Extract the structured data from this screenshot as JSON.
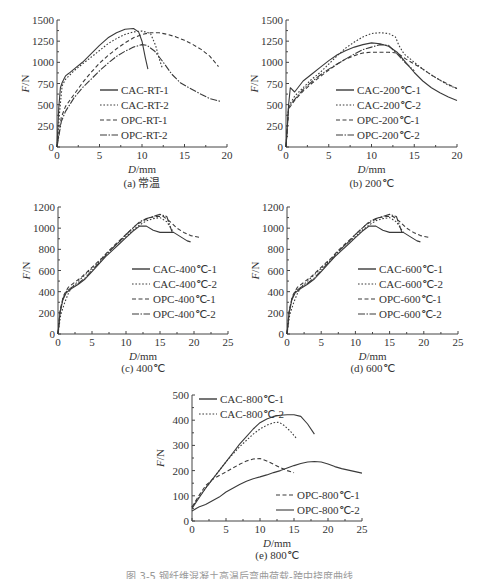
{
  "figure": {
    "caption_partial": "图 3-5  钢纤维混凝土高温后弯曲荷载-跨中挠度曲线"
  },
  "chart_data": [
    {
      "id": "a",
      "type": "line",
      "title": "(a) 常温",
      "xlabel": "D/mm",
      "ylabel": "F/N",
      "xlim": [
        0,
        20
      ],
      "ylim": [
        0,
        1500
      ],
      "xticks": [
        0,
        5,
        10,
        15,
        20
      ],
      "yticks": [
        0,
        250,
        500,
        750,
        1000,
        1250,
        1500
      ],
      "legend_position": "center-right",
      "series": [
        {
          "name": "CAC-RT-1",
          "style": "solid",
          "x": [
            0,
            0.2,
            0.4,
            0.6,
            0.8,
            1.0,
            1.4,
            2,
            3,
            4,
            5,
            6,
            7,
            8,
            9,
            9.6,
            10,
            10.4,
            10.7
          ],
          "y": [
            0,
            450,
            700,
            760,
            800,
            840,
            870,
            920,
            1000,
            1100,
            1200,
            1290,
            1350,
            1390,
            1400,
            1360,
            1250,
            1050,
            920
          ]
        },
        {
          "name": "CAC-RT-2",
          "style": "dotted",
          "x": [
            0,
            0.3,
            0.6,
            1,
            2,
            3,
            4,
            5,
            6,
            7,
            8,
            9,
            10,
            11,
            11.6,
            12,
            12.4
          ],
          "y": [
            0,
            400,
            720,
            800,
            900,
            980,
            1060,
            1140,
            1220,
            1280,
            1330,
            1360,
            1370,
            1340,
            1200,
            1050,
            930
          ]
        },
        {
          "name": "OPC-RT-1",
          "style": "dashed",
          "x": [
            0,
            0.5,
            1,
            2,
            3,
            4,
            5,
            6,
            7,
            8,
            9,
            10,
            11,
            12,
            13,
            14,
            15,
            16,
            17,
            18,
            19
          ],
          "y": [
            0,
            350,
            480,
            620,
            760,
            880,
            990,
            1080,
            1160,
            1230,
            1290,
            1330,
            1350,
            1350,
            1330,
            1300,
            1260,
            1210,
            1150,
            1070,
            950
          ]
        },
        {
          "name": "OPC-RT-2",
          "style": "dashdot",
          "x": [
            0,
            0.5,
            1,
            2,
            3,
            4,
            5,
            6,
            7,
            8,
            9,
            10,
            10.6,
            11.5,
            12.5,
            13.5,
            14.5,
            15.5,
            17,
            18,
            19.2
          ],
          "y": [
            0,
            300,
            420,
            580,
            700,
            800,
            900,
            990,
            1070,
            1130,
            1180,
            1210,
            1200,
            1130,
            1000,
            860,
            760,
            700,
            620,
            570,
            540
          ]
        }
      ]
    },
    {
      "id": "b",
      "type": "line",
      "title": "(b) 200℃",
      "xlabel": "D/mm",
      "ylabel": "F/N",
      "xlim": [
        0,
        20
      ],
      "ylim": [
        0,
        1500
      ],
      "xticks": [
        0,
        5,
        10,
        15,
        20
      ],
      "yticks": [
        0,
        250,
        500,
        750,
        1000,
        1250,
        1500
      ],
      "legend_position": "center-right",
      "series": [
        {
          "name": "CAC-200℃-1",
          "style": "solid",
          "x": [
            0,
            0.3,
            0.5,
            1,
            2,
            3,
            4,
            5,
            6,
            7,
            8,
            9,
            10,
            11,
            12,
            13,
            14,
            15,
            16,
            17,
            18,
            19,
            20
          ],
          "y": [
            0,
            500,
            700,
            650,
            780,
            860,
            940,
            1020,
            1090,
            1140,
            1180,
            1210,
            1230,
            1220,
            1190,
            1120,
            1000,
            880,
            780,
            700,
            640,
            590,
            550
          ]
        },
        {
          "name": "CAC-200℃-2",
          "style": "dotted",
          "x": [
            0,
            0.3,
            1,
            2,
            3,
            4,
            5,
            6,
            7,
            8,
            9,
            10,
            11,
            12,
            12.8,
            13.2,
            13.8,
            15,
            16,
            17,
            18,
            19,
            20
          ],
          "y": [
            0,
            480,
            600,
            700,
            800,
            880,
            980,
            1080,
            1170,
            1240,
            1300,
            1340,
            1350,
            1340,
            1300,
            1200,
            1100,
            1000,
            920,
            850,
            790,
            730,
            690
          ]
        },
        {
          "name": "OPC-200℃-1",
          "style": "dashed",
          "x": [
            0,
            0.3,
            1,
            2,
            3,
            4,
            5,
            6,
            7,
            8,
            9,
            10,
            11,
            12,
            13,
            14,
            15,
            16,
            17,
            18,
            19,
            20
          ],
          "y": [
            0,
            450,
            550,
            660,
            750,
            830,
            910,
            980,
            1040,
            1080,
            1110,
            1120,
            1120,
            1120,
            1110,
            1040,
            980,
            920,
            850,
            790,
            740,
            690
          ]
        },
        {
          "name": "OPC-200℃-2",
          "style": "dashdot",
          "x": [
            0,
            0.3,
            1,
            2,
            3,
            4,
            5,
            6,
            7,
            8,
            9,
            10,
            11,
            12,
            13,
            14,
            15
          ],
          "y": [
            0,
            470,
            560,
            680,
            770,
            850,
            920,
            980,
            1040,
            1100,
            1150,
            1180,
            1210,
            1200,
            1100,
            990,
            900
          ]
        }
      ]
    },
    {
      "id": "c",
      "type": "line",
      "title": "(c) 400℃",
      "xlabel": "D/mm",
      "ylabel": "F/N",
      "xlim": [
        0,
        25
      ],
      "ylim": [
        0,
        1200
      ],
      "xticks": [
        0,
        5,
        10,
        15,
        20,
        25
      ],
      "yticks": [
        0,
        200,
        400,
        600,
        800,
        1000,
        1200
      ],
      "legend_position": "center-right",
      "series": [
        {
          "name": "CAC-400℃-1",
          "style": "solid",
          "x": [
            0,
            0.3,
            0.7,
            1.2,
            2,
            3,
            4,
            5,
            6,
            7,
            8,
            9,
            10,
            11,
            12,
            13,
            14,
            15,
            16,
            17,
            18,
            19,
            19.5
          ],
          "y": [
            0,
            200,
            320,
            390,
            430,
            470,
            520,
            590,
            660,
            730,
            790,
            850,
            910,
            970,
            1020,
            1020,
            980,
            960,
            960,
            960,
            920,
            880,
            870
          ]
        },
        {
          "name": "CAC-400℃-2",
          "style": "dotted",
          "x": [
            0,
            0.4,
            1,
            1.5,
            2,
            3,
            4,
            5,
            6,
            7,
            8,
            9,
            10,
            11,
            12,
            13,
            14,
            15,
            16,
            17
          ],
          "y": [
            0,
            180,
            300,
            380,
            440,
            500,
            560,
            620,
            680,
            750,
            810,
            870,
            920,
            980,
            1030,
            1070,
            1090,
            1100,
            1060,
            960
          ]
        },
        {
          "name": "OPC-400℃-1",
          "style": "dashed",
          "x": [
            0,
            0.3,
            0.8,
            1.5,
            2.5,
            3.5,
            4.5,
            5.5,
            6.5,
            7.5,
            8.5,
            9.5,
            10.5,
            11.5,
            12.5,
            13.5,
            14.5,
            15.5,
            16.5,
            17.5,
            18.5,
            19.5,
            21
          ],
          "y": [
            0,
            220,
            360,
            440,
            490,
            540,
            600,
            660,
            720,
            790,
            850,
            910,
            970,
            1030,
            1070,
            1100,
            1110,
            1110,
            1060,
            1000,
            960,
            930,
            910
          ]
        },
        {
          "name": "OPC-400℃-2",
          "style": "dashdot",
          "x": [
            0,
            0.3,
            0.7,
            1.2,
            2,
            3,
            4,
            5,
            6,
            7,
            8,
            9,
            10,
            11,
            12,
            13,
            14,
            15,
            16,
            16.8
          ],
          "y": [
            0,
            200,
            330,
            400,
            440,
            480,
            530,
            600,
            670,
            740,
            810,
            870,
            940,
            1000,
            1060,
            1090,
            1110,
            1130,
            1110,
            960
          ]
        }
      ]
    },
    {
      "id": "d",
      "type": "line",
      "title": "(d) 600℃",
      "xlabel": "D/mm",
      "ylabel": "F/N",
      "xlim": [
        0,
        25
      ],
      "ylim": [
        0,
        1200
      ],
      "xticks": [
        0,
        5,
        10,
        15,
        20,
        25
      ],
      "yticks": [
        0,
        200,
        400,
        600,
        800,
        1000,
        1200
      ],
      "legend_position": "center-right",
      "series": [
        {
          "name": "CAC-600℃-1",
          "style": "solid",
          "x": [
            0,
            0.3,
            0.7,
            1.2,
            2,
            3,
            4,
            5,
            6,
            7,
            8,
            9,
            10,
            11,
            12,
            13,
            14,
            15,
            16,
            17,
            18,
            19,
            19.5
          ],
          "y": [
            0,
            200,
            320,
            390,
            430,
            470,
            520,
            590,
            660,
            730,
            790,
            850,
            910,
            970,
            1020,
            1020,
            980,
            960,
            960,
            960,
            920,
            880,
            870
          ]
        },
        {
          "name": "CAC-600℃-2",
          "style": "dotted",
          "x": [
            0,
            0.4,
            1,
            1.5,
            2,
            3,
            4,
            5,
            6,
            7,
            8,
            9,
            10,
            11,
            12,
            13,
            14,
            15,
            16,
            17
          ],
          "y": [
            0,
            180,
            300,
            380,
            440,
            500,
            560,
            620,
            680,
            750,
            810,
            870,
            920,
            980,
            1030,
            1070,
            1090,
            1100,
            1060,
            960
          ]
        },
        {
          "name": "OPC-600℃-1",
          "style": "dashed",
          "x": [
            0,
            0.3,
            0.8,
            1.5,
            2.5,
            3.5,
            4.5,
            5.5,
            6.5,
            7.5,
            8.5,
            9.5,
            10.5,
            11.5,
            12.5,
            13.5,
            14.5,
            15.5,
            16.5,
            17.5,
            18.5,
            19.5,
            21
          ],
          "y": [
            0,
            220,
            360,
            440,
            490,
            540,
            600,
            660,
            720,
            790,
            850,
            910,
            970,
            1030,
            1070,
            1100,
            1110,
            1110,
            1060,
            1000,
            960,
            930,
            910
          ]
        },
        {
          "name": "OPC-600℃-2",
          "style": "dashdot",
          "x": [
            0,
            0.3,
            0.7,
            1.2,
            2,
            3,
            4,
            5,
            6,
            7,
            8,
            9,
            10,
            11,
            12,
            13,
            14,
            15,
            16,
            16.8
          ],
          "y": [
            0,
            200,
            330,
            400,
            440,
            480,
            530,
            600,
            670,
            740,
            810,
            870,
            940,
            1000,
            1060,
            1090,
            1110,
            1130,
            1110,
            960
          ]
        }
      ]
    },
    {
      "id": "e",
      "type": "line",
      "title": "(e) 800℃",
      "xlabel": "D/mm",
      "ylabel": "F/N",
      "xlim": [
        0,
        25
      ],
      "ylim": [
        0,
        500
      ],
      "xticks": [
        0,
        5,
        10,
        15,
        20,
        25
      ],
      "yticks": [
        0,
        100,
        200,
        300,
        400,
        500
      ],
      "legend_position": "split: top-left (CAC), lower-right (OPC)",
      "series": [
        {
          "name": "CAC-800℃-1",
          "style": "solid",
          "x": [
            0,
            1,
            2,
            3,
            4,
            5,
            6,
            7,
            8,
            9,
            10,
            11,
            12,
            13,
            14,
            15,
            16,
            17,
            18
          ],
          "y": [
            50,
            90,
            130,
            165,
            200,
            235,
            270,
            305,
            335,
            365,
            390,
            405,
            415,
            420,
            422,
            422,
            415,
            385,
            345
          ]
        },
        {
          "name": "CAC-800℃-2",
          "style": "dotted",
          "x": [
            0,
            1,
            2,
            3,
            4,
            5,
            6,
            7,
            8,
            9,
            10,
            11,
            12,
            12.8,
            13.5,
            14.5,
            15.3
          ],
          "y": [
            55,
            95,
            130,
            165,
            200,
            235,
            265,
            295,
            320,
            345,
            365,
            380,
            390,
            392,
            380,
            355,
            330
          ]
        },
        {
          "name": "OPC-800℃-1",
          "style": "dashed",
          "x": [
            0,
            1,
            2,
            3,
            4,
            5,
            6,
            7,
            8,
            9,
            10,
            11,
            12,
            13,
            14,
            15
          ],
          "y": [
            55,
            100,
            140,
            165,
            180,
            195,
            210,
            225,
            238,
            246,
            248,
            238,
            225,
            212,
            200,
            192
          ]
        },
        {
          "name": "OPC-800℃-2",
          "style": "solid-thin",
          "x": [
            0,
            1,
            2,
            3,
            4,
            5,
            6,
            7,
            8,
            9,
            10,
            11,
            12,
            13,
            14,
            15,
            16,
            17,
            18,
            19,
            20,
            21,
            22,
            23,
            24,
            25
          ],
          "y": [
            40,
            55,
            65,
            80,
            95,
            115,
            130,
            145,
            158,
            168,
            175,
            183,
            192,
            200,
            210,
            220,
            228,
            234,
            236,
            234,
            226,
            216,
            208,
            202,
            196,
            190
          ]
        }
      ]
    }
  ]
}
